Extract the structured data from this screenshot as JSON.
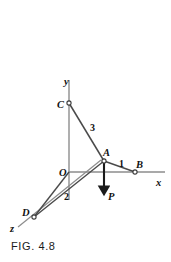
{
  "figure": {
    "caption": "FIG. 4.8",
    "background_color": "#ffffff",
    "line_color": "#4d4d4d",
    "axis_color": "#8a8a8a",
    "text_color": "#111111"
  },
  "axes": [
    {
      "name": "y-axis",
      "label": "y",
      "label_x": 64,
      "label_y": 85,
      "x1": 69,
      "y1": 80,
      "x2": 69,
      "y2": 200
    },
    {
      "name": "x-axis",
      "label": "x",
      "label_x": 156,
      "label_y": 186,
      "x1": 69,
      "y1": 172,
      "x2": 165,
      "y2": 172
    },
    {
      "name": "z-axis",
      "label": "z",
      "label_x": 10,
      "label_y": 232,
      "x1": 101,
      "y1": 160,
      "x2": 18,
      "y2": 227
    }
  ],
  "points": [
    {
      "name": "O",
      "label": "O",
      "x": 69,
      "y": 172,
      "label_x": 59,
      "label_y": 176,
      "marker": false
    },
    {
      "name": "A",
      "label": "A",
      "x": 104,
      "y": 161,
      "label_x": 103,
      "label_y": 156,
      "marker": true
    },
    {
      "name": "B",
      "label": "B",
      "x": 135,
      "y": 172,
      "label_x": 136,
      "label_y": 168,
      "marker": true
    },
    {
      "name": "C",
      "label": "C",
      "x": 69,
      "y": 103,
      "label_x": 57,
      "label_y": 108,
      "marker": true
    },
    {
      "name": "D",
      "label": "D",
      "x": 34,
      "y": 217,
      "label_x": 22,
      "label_y": 216,
      "marker": true
    }
  ],
  "members": [
    {
      "name": "member-CA",
      "from": "C",
      "to": "A",
      "x1": 69,
      "y1": 103,
      "x2": 104,
      "y2": 161,
      "length_label": "3",
      "label_x": 90,
      "label_y": 131
    },
    {
      "name": "member-AB",
      "from": "A",
      "to": "B",
      "x1": 104,
      "y1": 161,
      "x2": 135,
      "y2": 172,
      "length_label": "1",
      "label_x": 119,
      "label_y": 167
    },
    {
      "name": "member-AD",
      "from": "A",
      "to": "D",
      "x1": 104,
      "y1": 161,
      "x2": 34,
      "y2": 217,
      "length_label": "2",
      "label_x": 64,
      "label_y": 200
    },
    {
      "name": "member-OD",
      "from": "O",
      "to": "D",
      "x1": 69,
      "y1": 172,
      "x2": 34,
      "y2": 217,
      "length_label": "",
      "label_x": 0,
      "label_y": 0
    }
  ],
  "load": {
    "name": "load-P",
    "label": "P",
    "from_x": 104,
    "from_y": 161,
    "to_x": 104,
    "to_y": 192,
    "label_x": 108,
    "label_y": 200,
    "direction": "down"
  }
}
